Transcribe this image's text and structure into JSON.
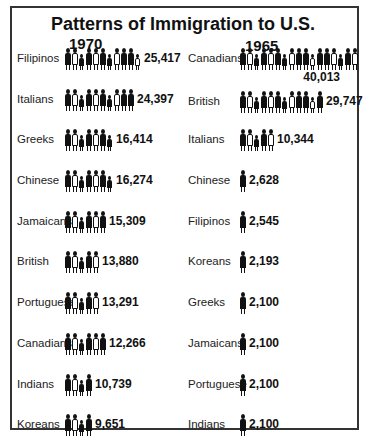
{
  "chart_data": {
    "type": "pictograph",
    "title": "Patterns of Immigration to U.S.",
    "panels": [
      {
        "year": "1970",
        "categories": [
          "Filipinos",
          "Italians",
          "Greeks",
          "Chinese",
          "Jamaicans",
          "British",
          "Portuguese",
          "Canadians",
          "Indians",
          "Koreans"
        ],
        "values": [
          25417,
          24397,
          16414,
          16274,
          15309,
          13880,
          13291,
          12266,
          10739,
          9651
        ],
        "value_labels": [
          "25,417",
          "24,397",
          "16,414",
          "16,274",
          "15,309",
          "13,880",
          "13,291",
          "12,266",
          "10,739",
          "9,651"
        ]
      },
      {
        "year": "1965",
        "categories": [
          "Canadians",
          "British",
          "Italians",
          "Chinese",
          "Filipinos",
          "Koreans",
          "Greeks",
          "Jamaicans",
          "Portuguese",
          "Indians"
        ],
        "values": [
          40013,
          29747,
          10344,
          2628,
          2545,
          2193,
          2100,
          2100,
          2100,
          2100
        ],
        "value_labels": [
          "40,013",
          "29,747",
          "10,344",
          "2,628",
          "2,545",
          "2,193",
          "2,100",
          "2,100",
          "2,100",
          "2,100"
        ]
      }
    ]
  },
  "title": "Patterns of Immigration to U.S.",
  "left": {
    "year": "1970",
    "rows": [
      {
        "label": "Filipinos",
        "value": "25,417",
        "figs": 11
      },
      {
        "label": "Italians",
        "value": "24,397",
        "figs": 10
      },
      {
        "label": "Greeks",
        "value": "16,414",
        "figs": 7
      },
      {
        "label": "Chinese",
        "value": "16,274",
        "figs": 7
      },
      {
        "label": "Jamaicans",
        "value": "15,309",
        "figs": 6
      },
      {
        "label": "British",
        "value": "13,880",
        "figs": 5
      },
      {
        "label": "Portuguese",
        "value": "13,291",
        "figs": 5
      },
      {
        "label": "Canadians",
        "value": "12,266",
        "figs": 6
      },
      {
        "label": "Indians",
        "value": "10,739",
        "figs": 4
      },
      {
        "label": "Koreans",
        "value": "9,651",
        "figs": 4
      }
    ]
  },
  "right": {
    "year": "1965",
    "rows": [
      {
        "label": "Canadians",
        "value": "40,013",
        "figs": 17
      },
      {
        "label": "British",
        "value": "29,747",
        "figs": 12
      },
      {
        "label": "Italians",
        "value": "10,344",
        "figs": 5
      },
      {
        "label": "Chinese",
        "value": "2,628",
        "figs": 1
      },
      {
        "label": "Filipinos",
        "value": "2,545",
        "figs": 1
      },
      {
        "label": "Koreans",
        "value": "2,193",
        "figs": 1
      },
      {
        "label": "Greeks",
        "value": "2,100",
        "figs": 1
      },
      {
        "label": "Jamaicans",
        "value": "2,100",
        "figs": 1
      },
      {
        "label": "Portuguese",
        "value": "2,100",
        "figs": 1
      },
      {
        "label": "Indians",
        "value": "2,100",
        "figs": 1
      }
    ]
  }
}
